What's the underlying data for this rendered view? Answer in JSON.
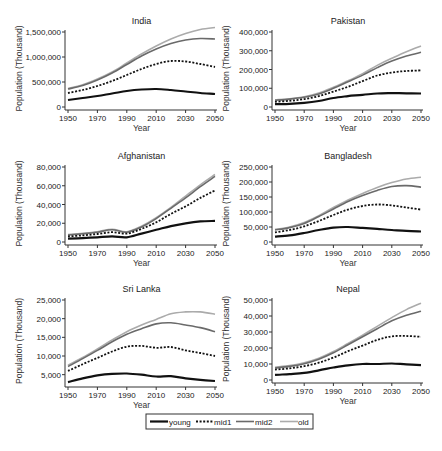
{
  "chart_data": [
    {
      "type": "line",
      "title": "India",
      "xlabel": "Year",
      "ylabel": "Population (Thousand)",
      "xlim": [
        1950,
        2050
      ],
      "ylim": [
        0,
        1600000
      ],
      "xticks": [
        "1950",
        "1970",
        "1990",
        "2010",
        "2030",
        "2050"
      ],
      "yticks": [
        0,
        500000,
        1000000,
        1500000
      ],
      "ytick_labels": [
        "0",
        "500,000",
        "1,000,000",
        "1,500,000"
      ],
      "x": [
        1950,
        1960,
        1970,
        1980,
        1990,
        2000,
        2010,
        2020,
        2030,
        2040,
        2050
      ],
      "series": [
        {
          "name": "young",
          "values": [
            140000,
            180000,
            220000,
            270000,
            320000,
            350000,
            360000,
            340000,
            310000,
            280000,
            260000
          ]
        },
        {
          "name": "mid1",
          "values": [
            280000,
            340000,
            420000,
            520000,
            640000,
            760000,
            860000,
            920000,
            910000,
            860000,
            800000
          ]
        },
        {
          "name": "mid2",
          "values": [
            360000,
            430000,
            540000,
            680000,
            850000,
            1020000,
            1160000,
            1270000,
            1340000,
            1370000,
            1360000
          ]
        },
        {
          "name": "old",
          "values": [
            370000,
            445000,
            560000,
            700000,
            880000,
            1060000,
            1220000,
            1360000,
            1470000,
            1550000,
            1590000
          ]
        }
      ]
    },
    {
      "type": "line",
      "title": "Pakistan",
      "xlabel": "Year",
      "ylabel": "Population (Thousand)",
      "xlim": [
        1950,
        2050
      ],
      "ylim": [
        0,
        400000
      ],
      "xticks": [
        "1950",
        "1970",
        "1990",
        "2010",
        "2030",
        "2050"
      ],
      "yticks": [
        0,
        100000,
        200000,
        300000,
        400000
      ],
      "ytick_labels": [
        "0",
        "100,000",
        "200,000",
        "300,000",
        "400,000"
      ],
      "x": [
        1950,
        1960,
        1970,
        1980,
        1990,
        2000,
        2010,
        2020,
        2030,
        2040,
        2050
      ],
      "series": [
        {
          "name": "young",
          "values": [
            15000,
            17000,
            22000,
            32000,
            48000,
            58000,
            65000,
            72000,
            74000,
            73000,
            72000
          ]
        },
        {
          "name": "mid1",
          "values": [
            28000,
            33000,
            42000,
            58000,
            82000,
            108000,
            138000,
            168000,
            184000,
            192000,
            195000
          ]
        },
        {
          "name": "mid2",
          "values": [
            36000,
            42000,
            52000,
            70000,
            100000,
            135000,
            170000,
            210000,
            245000,
            272000,
            292000
          ]
        },
        {
          "name": "old",
          "values": [
            38000,
            44000,
            55000,
            74000,
            105000,
            140000,
            178000,
            222000,
            260000,
            295000,
            325000
          ]
        }
      ]
    },
    {
      "type": "line",
      "title": "Afghanistan",
      "xlabel": "Year",
      "ylabel": "Population (Thousand)",
      "xlim": [
        1950,
        2050
      ],
      "ylim": [
        0,
        80000
      ],
      "xticks": [
        "1950",
        "1970",
        "1990",
        "2010",
        "2030",
        "2050"
      ],
      "yticks": [
        0,
        20000,
        40000,
        60000,
        80000
      ],
      "ytick_labels": [
        "0",
        "20,000",
        "40,000",
        "60,000",
        "80,000"
      ],
      "x": [
        1950,
        1960,
        1970,
        1980,
        1990,
        2000,
        2010,
        2020,
        2030,
        2040,
        2050
      ],
      "series": [
        {
          "name": "young",
          "values": [
            3500,
            4200,
            5000,
            6000,
            5000,
            9000,
            13000,
            17000,
            20000,
            22000,
            22500
          ]
        },
        {
          "name": "mid1",
          "values": [
            6000,
            7000,
            8500,
            10500,
            9000,
            14000,
            21000,
            30000,
            38000,
            47000,
            55000
          ]
        },
        {
          "name": "mid2",
          "values": [
            7500,
            8800,
            10500,
            13000,
            10500,
            16000,
            25000,
            36000,
            47000,
            59000,
            70000
          ]
        },
        {
          "name": "old",
          "values": [
            8000,
            9300,
            11000,
            13500,
            11000,
            17000,
            26000,
            37000,
            49000,
            61000,
            72000
          ]
        }
      ]
    },
    {
      "type": "line",
      "title": "Bangladesh",
      "xlabel": "Year",
      "ylabel": "Population (Thousand)",
      "xlim": [
        1950,
        2050
      ],
      "ylim": [
        0,
        250000
      ],
      "xticks": [
        "1950",
        "1970",
        "1990",
        "2010",
        "2030",
        "2050"
      ],
      "yticks": [
        0,
        50000,
        100000,
        150000,
        200000,
        250000
      ],
      "ytick_labels": [
        "0",
        "50,000",
        "100,000",
        "150,000",
        "200,000",
        "250,000"
      ],
      "x": [
        1950,
        1960,
        1970,
        1980,
        1990,
        2000,
        2010,
        2020,
        2030,
        2040,
        2050
      ],
      "series": [
        {
          "name": "young",
          "values": [
            18000,
            22000,
            30000,
            40000,
            48000,
            50000,
            47000,
            44000,
            40000,
            37000,
            35000
          ]
        },
        {
          "name": "mid1",
          "values": [
            32000,
            40000,
            52000,
            70000,
            90000,
            108000,
            120000,
            125000,
            122000,
            115000,
            108000
          ]
        },
        {
          "name": "mid2",
          "values": [
            40000,
            48000,
            62000,
            85000,
            110000,
            135000,
            155000,
            172000,
            185000,
            188000,
            183000
          ]
        },
        {
          "name": "old",
          "values": [
            42000,
            50000,
            65000,
            88000,
            115000,
            140000,
            162000,
            182000,
            198000,
            210000,
            216000
          ]
        }
      ]
    },
    {
      "type": "line",
      "title": "Sri Lanka",
      "xlabel": "Year",
      "ylabel": "Population (Thousand)",
      "xlim": [
        1950,
        2050
      ],
      "ylim": [
        2500,
        25000
      ],
      "xticks": [
        "1950",
        "1970",
        "1990",
        "2010",
        "2030",
        "2050"
      ],
      "yticks": [
        5000,
        10000,
        15000,
        20000,
        25000
      ],
      "ytick_labels": [
        "5,000",
        "10,000",
        "15,000",
        "20,000",
        "25,000"
      ],
      "x": [
        1950,
        1960,
        1970,
        1980,
        1990,
        2000,
        2010,
        2020,
        2030,
        2040,
        2050
      ],
      "series": [
        {
          "name": "young",
          "values": [
            3000,
            4000,
            4800,
            5200,
            5300,
            5000,
            4500,
            4600,
            4000,
            3600,
            3300
          ]
        },
        {
          "name": "mid1",
          "values": [
            6000,
            7800,
            9500,
            11200,
            12500,
            12700,
            12200,
            12400,
            11500,
            10800,
            10000
          ]
        },
        {
          "name": "mid2",
          "values": [
            7200,
            9300,
            11500,
            13800,
            15800,
            17300,
            18600,
            18900,
            18300,
            17600,
            16500
          ]
        },
        {
          "name": "old",
          "values": [
            7500,
            9600,
            11900,
            14300,
            16500,
            18300,
            19800,
            21300,
            21800,
            21800,
            21200
          ]
        }
      ]
    },
    {
      "type": "line",
      "title": "Nepal",
      "xlabel": "Year",
      "ylabel": "Population (Thousand)",
      "xlim": [
        1950,
        2050
      ],
      "ylim": [
        0,
        50000
      ],
      "xticks": [
        "1950",
        "1970",
        "1990",
        "2010",
        "2030",
        "2050"
      ],
      "yticks": [
        0,
        10000,
        20000,
        30000,
        40000,
        50000
      ],
      "ytick_labels": [
        "0",
        "10,000",
        "20,000",
        "30,000",
        "40,000",
        "50,000"
      ],
      "x": [
        1950,
        1960,
        1970,
        1980,
        1990,
        2000,
        2010,
        2020,
        2030,
        2040,
        2050
      ],
      "series": [
        {
          "name": "young",
          "values": [
            3200,
            3700,
            4500,
            6000,
            7800,
            9200,
            10000,
            10000,
            10300,
            9800,
            9300
          ]
        },
        {
          "name": "mid1",
          "values": [
            6500,
            7300,
            8600,
            10800,
            14000,
            18000,
            21500,
            25000,
            27300,
            27500,
            27000
          ]
        },
        {
          "name": "mid2",
          "values": [
            7500,
            8500,
            10200,
            13000,
            17000,
            22000,
            27000,
            32000,
            37000,
            40500,
            43000
          ]
        },
        {
          "name": "old",
          "values": [
            8000,
            9000,
            10800,
            13600,
            17800,
            22800,
            28000,
            33500,
            39000,
            44000,
            48000
          ]
        }
      ]
    }
  ],
  "legend": {
    "position": "bottom-center",
    "entries": [
      {
        "name": "young",
        "style": "solid-thick",
        "color": "#111111"
      },
      {
        "name": "mid1",
        "style": "dotted",
        "color": "#111111"
      },
      {
        "name": "mid2",
        "style": "solid",
        "color": "#666666"
      },
      {
        "name": "old",
        "style": "solid",
        "color": "#aaaaaa"
      }
    ]
  },
  "colors": {
    "young": "#111111",
    "mid1": "#111111",
    "mid2": "#6a6a6a",
    "old": "#ababab",
    "axis": "#333333"
  }
}
